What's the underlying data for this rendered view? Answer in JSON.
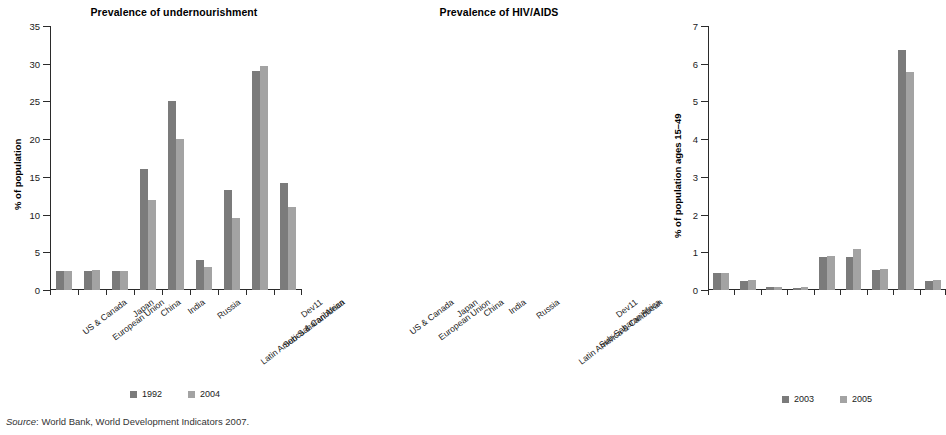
{
  "source_note": {
    "label": "Source",
    "text": ": World Bank, World Development Indicators 2007."
  },
  "charts": [
    {
      "id": "undernourishment",
      "chart_data": {
        "type": "bar",
        "title": "Prevalence of undernourishment",
        "xlabel": "",
        "ylabel": "% of population",
        "ylim": [
          0,
          35
        ],
        "yticks": [
          0,
          5,
          10,
          15,
          20,
          25,
          30,
          35
        ],
        "grid": false,
        "legend_position": "bottom",
        "categories": [
          "US & Canada",
          "European Union",
          "Japan",
          "China",
          "India",
          "Russia",
          "Latin America & Caribbean",
          "Sub-Saharan Africa",
          "Dev11"
        ],
        "series": [
          {
            "name": "1992",
            "color": "#7b7b7b",
            "values": [
              2.5,
              2.5,
              2.5,
              16.0,
              25.0,
              4.0,
              13.2,
              29.0,
              14.2
            ]
          },
          {
            "name": "2004",
            "color": "#a3a3a3",
            "values": [
              2.5,
              2.7,
              2.5,
              12.0,
              20.0,
              3.0,
              9.6,
              29.7,
              11.0
            ]
          }
        ]
      }
    },
    {
      "id": "hiv-aids",
      "chart_data": {
        "type": "bar",
        "title": "Prevalence of HIV/AIDS",
        "xlabel": "",
        "ylabel": "% of population ages 15–49",
        "ylim": [
          0,
          7
        ],
        "yticks": [
          0,
          1,
          2,
          3,
          4,
          5,
          6,
          7
        ],
        "grid": false,
        "legend_position": "bottom",
        "categories": [
          "US & Canada",
          "European Union",
          "Japan",
          "China",
          "India",
          "Russia",
          "Latin America & Caribbean",
          "Sub-Saharan Africa",
          "Dev11"
        ],
        "series": [
          {
            "name": "2003",
            "color": "#7b7b7b",
            "values": [
              0.45,
              0.25,
              0.08,
              0.05,
              0.88,
              0.87,
              0.53,
              6.37,
              0.25
            ]
          },
          {
            "name": "2005",
            "color": "#a3a3a3",
            "values": [
              0.45,
              0.26,
              0.09,
              0.07,
              0.91,
              1.08,
              0.57,
              5.78,
              0.26
            ]
          }
        ]
      }
    }
  ]
}
